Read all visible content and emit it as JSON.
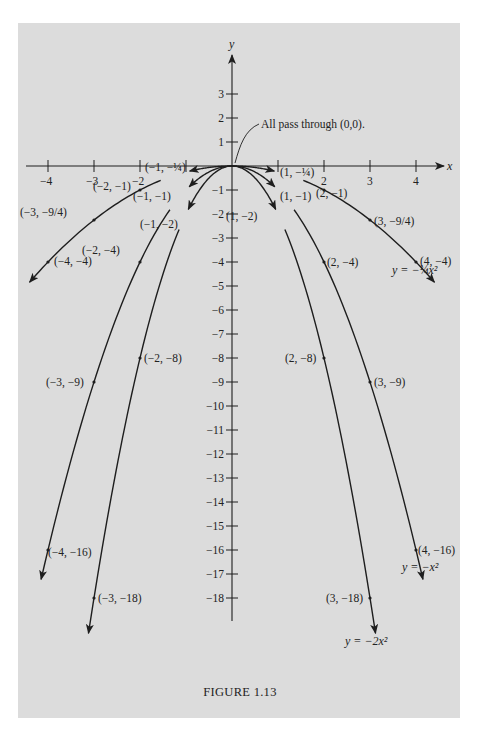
{
  "figure": {
    "caption": "FIGURE 1.13",
    "annotation": "All pass through (0,0).",
    "axis_x_label": "x",
    "axis_y_label": "y",
    "colors": {
      "background": "#dcdcdc",
      "ink": "#1e1e1e"
    }
  },
  "chart_data": {
    "type": "line",
    "title": "FIGURE 1.13",
    "xlabel": "x",
    "ylabel": "y",
    "xlim": [
      -4.5,
      4.6
    ],
    "ylim": [
      -19.5,
      4.5
    ],
    "grid": false,
    "x_ticks": [
      -4,
      -3,
      -2,
      -1,
      1,
      2,
      3,
      4
    ],
    "x_tick_labels": [
      "−4",
      "−3",
      "−2",
      "",
      "",
      "2",
      "3",
      "4"
    ],
    "y_ticks": [
      3,
      2,
      1,
      -1,
      -2,
      -3,
      -4,
      -5,
      -6,
      -7,
      -8,
      -9,
      -10,
      -11,
      -12,
      -13,
      -14,
      -15,
      -16,
      -17,
      -18
    ],
    "y_tick_labels": [
      "3",
      "2",
      "1",
      "−1",
      "−2",
      "−3",
      "−4",
      "−5",
      "−6",
      "−7",
      "−8",
      "−9",
      "−10",
      "−11",
      "−12",
      "−13",
      "−14",
      "−15",
      "−16",
      "−17",
      "−18"
    ],
    "annotations": [
      {
        "text": "All pass through (0,0).",
        "x": 0,
        "y": 0
      }
    ],
    "series": [
      {
        "name": "y = −¼x²",
        "coef": -0.25,
        "label_text": "y = −¼x²",
        "x_range": [
          -4.4,
          4.4
        ],
        "points": [
          {
            "x": -4,
            "y": -4,
            "label": "(−4, −4)"
          },
          {
            "x": -3,
            "y": -2.25,
            "label": "(−3, −9/4)"
          },
          {
            "x": -2,
            "y": -1,
            "label": "(−2, −1)"
          },
          {
            "x": -1,
            "y": -0.25,
            "label": "(−1, −¼)"
          },
          {
            "x": 1,
            "y": -0.25,
            "label": "(1, −¼)"
          },
          {
            "x": 2,
            "y": -1,
            "label": "(2, −1)"
          },
          {
            "x": 3,
            "y": -2.25,
            "label": "(3, −9/4)"
          },
          {
            "x": 4,
            "y": -4,
            "label": "(4, −4)"
          }
        ]
      },
      {
        "name": "y = −x²",
        "coef": -1,
        "label_text": "y = −x²",
        "x_range": [
          -4.15,
          4.15
        ],
        "points": [
          {
            "x": -4,
            "y": -16,
            "label": "(−4, −16)"
          },
          {
            "x": -2,
            "y": -4,
            "label": "(−2, −4)"
          },
          {
            "x": -1,
            "y": -1,
            "label": "(−1, −1)"
          },
          {
            "x": 1,
            "y": -1,
            "label": "(1, −1)"
          },
          {
            "x": 2,
            "y": -4,
            "label": "(2, −4)"
          },
          {
            "x": 4,
            "y": -16,
            "label": "(4, −16)"
          }
        ]
      },
      {
        "name": "y = −2x²",
        "coef": -2,
        "label_text": "y = −2x²",
        "x_range": [
          -3.12,
          3.12
        ],
        "points": [
          {
            "x": -3,
            "y": -18,
            "label": "(−3, −18)"
          },
          {
            "x": -2,
            "y": -8,
            "label": "(−2, −8)"
          },
          {
            "x": -1,
            "y": -2,
            "label": "(−1, −2)"
          },
          {
            "x": 1,
            "y": -2,
            "label": "(1, −2)"
          },
          {
            "x": 2,
            "y": -8,
            "label": "(2, −8)"
          },
          {
            "x": 3,
            "y": -18,
            "label": "(3, −18)"
          }
        ]
      }
    ],
    "extra_point_labels": [
      {
        "x": -3,
        "y": -9,
        "label": "(−3, −9)",
        "series": "y = −x²"
      },
      {
        "x": 3,
        "y": -9,
        "label": "(3, −9)",
        "series": "y = −x²"
      }
    ]
  }
}
